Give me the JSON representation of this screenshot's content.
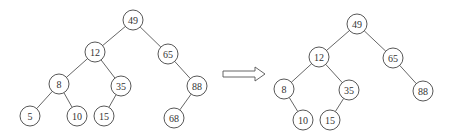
{
  "diagram": {
    "type": "binary-search-tree-deletion",
    "before": {
      "name": "tree-before",
      "nodes": [
        {
          "id": "n49",
          "label": "49"
        },
        {
          "id": "n12",
          "label": "12"
        },
        {
          "id": "n65",
          "label": "65"
        },
        {
          "id": "n8",
          "label": "8"
        },
        {
          "id": "n35",
          "label": "35"
        },
        {
          "id": "n88",
          "label": "88"
        },
        {
          "id": "n5",
          "label": "5"
        },
        {
          "id": "n10",
          "label": "10"
        },
        {
          "id": "n15",
          "label": "15"
        },
        {
          "id": "n68",
          "label": "68"
        }
      ],
      "edges": [
        [
          "n49",
          "n12"
        ],
        [
          "n49",
          "n65"
        ],
        [
          "n12",
          "n8"
        ],
        [
          "n12",
          "n35"
        ],
        [
          "n65",
          "n88"
        ],
        [
          "n8",
          "n5"
        ],
        [
          "n8",
          "n10"
        ],
        [
          "n35",
          "n15"
        ],
        [
          "n88",
          "n68"
        ]
      ]
    },
    "arrow": {
      "direction": "right",
      "meaning": "transforms-to"
    },
    "after": {
      "name": "tree-after",
      "nodes": [
        {
          "id": "m49",
          "label": "49"
        },
        {
          "id": "m12",
          "label": "12"
        },
        {
          "id": "m65",
          "label": "65"
        },
        {
          "id": "m8",
          "label": "8"
        },
        {
          "id": "m35",
          "label": "35"
        },
        {
          "id": "m88",
          "label": "88"
        },
        {
          "id": "m10",
          "label": "10"
        },
        {
          "id": "m15",
          "label": "15"
        }
      ],
      "edges": [
        [
          "m49",
          "m12"
        ],
        [
          "m49",
          "m65"
        ],
        [
          "m12",
          "m8"
        ],
        [
          "m12",
          "m35"
        ],
        [
          "m65",
          "m88"
        ],
        [
          "m8",
          "m10"
        ],
        [
          "m35",
          "m15"
        ]
      ]
    }
  }
}
